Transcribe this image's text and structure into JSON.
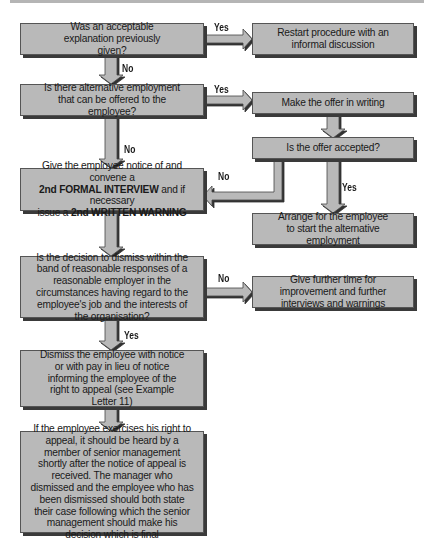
{
  "flowchart": {
    "nodes": {
      "q_explanation": {
        "text": "Was an acceptable explanation previously given?"
      },
      "restart": {
        "text": "Restart procedure with an informal discussion"
      },
      "q_alternative": {
        "text": "Is there alternative employment that can be offered to the employee?"
      },
      "make_offer": {
        "text": "Make the offer in writing"
      },
      "q_offer_accepted": {
        "text": "Is the offer accepted?"
      },
      "second_interview": {
        "line1": "Give the employee notice of and convene a",
        "line2_bold": "2nd FORMAL INTERVIEW",
        "line2_rest": " and if necessary",
        "line3_pre": "issue a ",
        "line3_bold": "2nd WRITTEN WARNING"
      },
      "arrange_start": {
        "text": "Arrange for the employee to start the alternative employment"
      },
      "q_reasonable": {
        "text": "Is the decision to dismiss within the band of reasonable responses of a reasonable employer in the circumstances having regard to the employee's job and the interests of the organisation?"
      },
      "further_time": {
        "text": "Give further time for improvement and further interviews and warnings"
      },
      "dismiss": {
        "text": "Dismiss the employee with notice or with pay in lieu of notice informing the employee of the right to appeal (see Example Letter 11)"
      },
      "appeal": {
        "text": "If the employee exercises his right to appeal, it should be heard by a member of senior management shortly after the notice of appeal is received. The manager who dismissed and the employee who has been dismissed should both state their case following which the senior management should make his decision which is final"
      }
    },
    "edge_labels": {
      "e1_yes": "Yes",
      "e1_no": "No",
      "e2_yes": "Yes",
      "e2_no": "No",
      "e3_no": "No",
      "e3_yes": "Yes",
      "e4_no": "No",
      "e4_yes": "Yes"
    },
    "colors": {
      "box_fill": "#b9b9b9",
      "box_shadow": "#3a3a3a",
      "arrow_fill": "#b9b9b9",
      "text": "#1a1a1a"
    }
  }
}
